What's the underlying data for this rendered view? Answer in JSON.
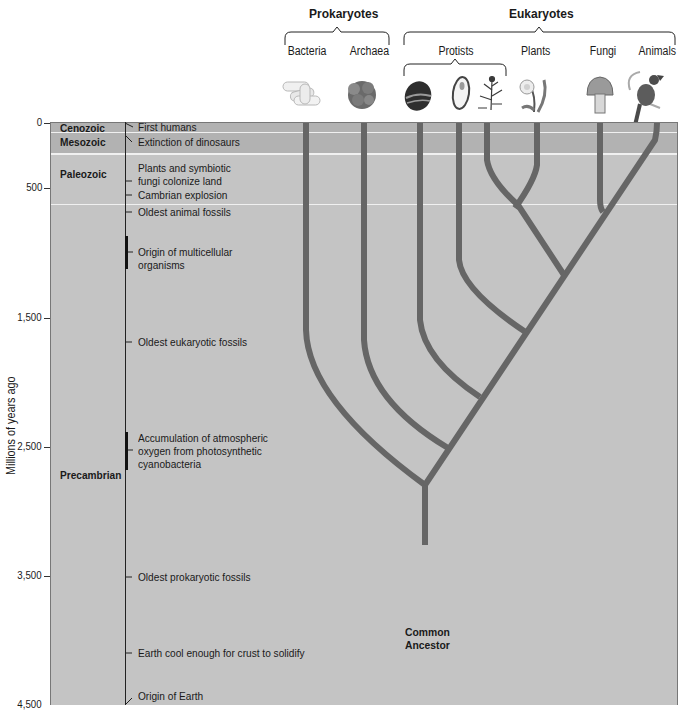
{
  "headers": {
    "prokaryotes": "Prokaryotes",
    "eukaryotes": "Eukaryotes"
  },
  "groups": [
    {
      "label": "Bacteria",
      "icon": "bacteria-icon"
    },
    {
      "label": "Archaea",
      "icon": "archaea-icon"
    },
    {
      "label": "Protists",
      "icon": "protists-icon"
    },
    {
      "label": "Plants",
      "icon": "plant-icon"
    },
    {
      "label": "Fungi",
      "icon": "mushroom-icon"
    },
    {
      "label": "Animals",
      "icon": "bird-icon"
    }
  ],
  "axis": {
    "label": "Millions of years ago",
    "ticks": [
      "0",
      "500",
      "1,500",
      "2,500",
      "3,500",
      "4,500"
    ]
  },
  "eras": [
    {
      "name": "Cenozoic"
    },
    {
      "name": "Mesozoic"
    },
    {
      "name": "Paleozoic"
    },
    {
      "name": "Precambrian"
    }
  ],
  "events": [
    {
      "text": "First humans"
    },
    {
      "text": "Extinction of dinosaurs"
    },
    {
      "text": "Plants and symbiotic",
      "text2": "fungi colonize land"
    },
    {
      "text": "Cambrian explosion"
    },
    {
      "text": "Oldest animal fossils"
    },
    {
      "text": "Origin of multicellular",
      "text2": "organisms"
    },
    {
      "text": "Oldest eukaryotic fossils"
    },
    {
      "text": "Accumulation of atmospheric",
      "text2": "oxygen from photosynthetic",
      "text3": "cyanobacteria"
    },
    {
      "text": "Oldest prokaryotic fossils"
    },
    {
      "text": "Earth cool enough for crust to solidify"
    },
    {
      "text": "Origin of Earth"
    }
  ],
  "root": {
    "line1": "Common",
    "line2": "Ancestor"
  },
  "colors": {
    "panel": "#c4c4c4",
    "recent_band": "#b2b2b2",
    "branch": "#666666",
    "band_line": "#f2f2f2"
  }
}
